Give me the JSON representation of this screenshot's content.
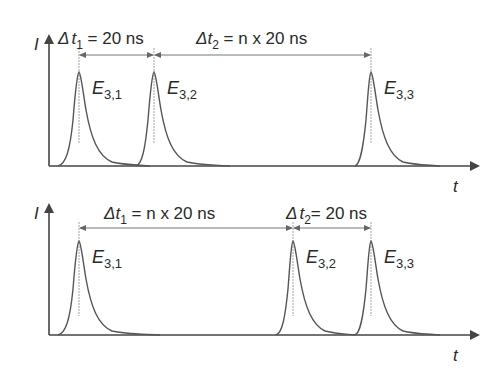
{
  "figure": {
    "type": "pulse timing diagram",
    "panels": [
      {
        "id": "top",
        "y_axis_label": "I",
        "x_axis_label": "t",
        "pulses": [
          {
            "label_main": "E",
            "label_sub": "3,1",
            "x": 79
          },
          {
            "label_main": "E",
            "label_sub": "3,2",
            "x": 154
          },
          {
            "label_main": "E",
            "label_sub": "3,3",
            "x": 371
          }
        ],
        "intervals": [
          {
            "delta": "Δ",
            "var": "t",
            "sub": "1",
            "value": " = 20 ns"
          },
          {
            "delta": "Δ",
            "var": "t",
            "sub": "2",
            "value": " = n x 20 ns"
          }
        ]
      },
      {
        "id": "bottom",
        "y_axis_label": "I",
        "x_axis_label": "t",
        "pulses": [
          {
            "label_main": "E",
            "label_sub": "3,1",
            "x": 79
          },
          {
            "label_main": "E",
            "label_sub": "3,2",
            "x": 293
          },
          {
            "label_main": "E",
            "label_sub": "3,3",
            "x": 371
          }
        ],
        "intervals": [
          {
            "delta": "Δ",
            "var": "t",
            "sub": "1",
            "value": " = n x 20 ns"
          },
          {
            "delta": "Δ",
            "var": "t",
            "sub": "2",
            "value": "= 20 ns"
          }
        ]
      }
    ],
    "colors": {
      "line": "#555555",
      "text": "#2a2a2a",
      "dimension": "#777777"
    }
  }
}
